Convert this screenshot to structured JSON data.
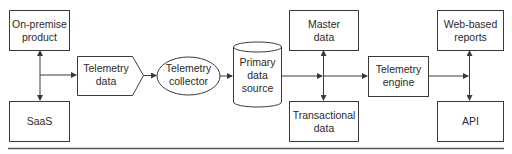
{
  "diagram": {
    "nodes": {
      "on_premise": {
        "lines": [
          "On-premise",
          "product"
        ],
        "shape": "rectangle"
      },
      "saas": {
        "lines": [
          "SaaS"
        ],
        "shape": "rectangle"
      },
      "telemetry_data": {
        "lines": [
          "Telemetry",
          "data"
        ],
        "shape": "pentagon-arrow"
      },
      "telemetry_collector": {
        "lines": [
          "Telemetry",
          "collector"
        ],
        "shape": "ellipse"
      },
      "primary_data_source": {
        "lines": [
          "Primary",
          "data",
          "source"
        ],
        "shape": "cylinder"
      },
      "master_data": {
        "lines": [
          "Master",
          "data"
        ],
        "shape": "rectangle"
      },
      "transactional_data": {
        "lines": [
          "Transactional",
          "data"
        ],
        "shape": "rectangle"
      },
      "telemetry_engine": {
        "lines": [
          "Telemetry",
          "engine"
        ],
        "shape": "rectangle"
      },
      "web_reports": {
        "lines": [
          "Web-based",
          "reports"
        ],
        "shape": "rectangle"
      },
      "api": {
        "lines": [
          "API"
        ],
        "shape": "rectangle"
      }
    },
    "edges": [
      {
        "from": "junction-left",
        "to": "on_premise",
        "type": "arrow"
      },
      {
        "from": "junction-left",
        "to": "saas",
        "type": "arrow"
      },
      {
        "from": "junction-left",
        "to": "telemetry_data",
        "type": "arrow"
      },
      {
        "from": "telemetry_data",
        "to": "telemetry_collector",
        "type": "arrow"
      },
      {
        "from": "telemetry_collector",
        "to": "primary_data_source",
        "type": "arrow"
      },
      {
        "from": "primary_data_source",
        "to": "junction-middle",
        "type": "arrow"
      },
      {
        "from": "junction-middle",
        "to": "master_data",
        "type": "arrow"
      },
      {
        "from": "junction-middle",
        "to": "transactional_data",
        "type": "arrow"
      },
      {
        "from": "junction-middle",
        "to": "telemetry_engine",
        "type": "arrow"
      },
      {
        "from": "telemetry_engine",
        "to": "junction-right",
        "type": "arrow"
      },
      {
        "from": "junction-right",
        "to": "web_reports",
        "type": "arrow"
      },
      {
        "from": "junction-right",
        "to": "api",
        "type": "arrow"
      }
    ]
  }
}
